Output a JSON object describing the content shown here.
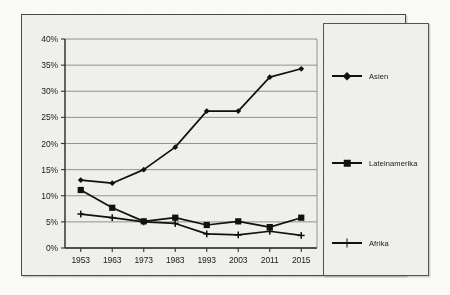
{
  "chart_data": {
    "type": "line",
    "title": "",
    "subtitle": "",
    "xlabel": "",
    "ylabel": "",
    "categories": [
      "1953",
      "1963",
      "1973",
      "1983",
      "1993",
      "2003",
      "2011",
      "2015"
    ],
    "ytick_labels": [
      "0%",
      "5%",
      "10%",
      "15%",
      "20%",
      "25%",
      "30%",
      "35%",
      "40%"
    ],
    "ytick_values": [
      0,
      5,
      10,
      15,
      20,
      25,
      30,
      35,
      40
    ],
    "ylim": [
      0,
      40
    ],
    "grid": "horizontal",
    "legend_position": "right-outside",
    "series": [
      {
        "name": "Asien",
        "marker": "diamond",
        "color": "#111111",
        "values": [
          13.0,
          12.4,
          15.0,
          19.3,
          26.2,
          26.2,
          32.7,
          34.3
        ]
      },
      {
        "name": "Lateinamerika",
        "marker": "square",
        "color": "#111111",
        "values": [
          11.1,
          7.7,
          5.1,
          5.8,
          4.4,
          5.1,
          4.0,
          5.8
        ]
      },
      {
        "name": "Afrika",
        "marker": "plus",
        "color": "#111111",
        "values": [
          6.5,
          5.8,
          5.0,
          4.7,
          2.7,
          2.5,
          3.2,
          2.4
        ]
      }
    ]
  },
  "legend": {
    "entries": [
      {
        "label": "Asien",
        "marker": "diamond"
      },
      {
        "label": "Lateinamerika",
        "marker": "square"
      },
      {
        "label": "Afrika",
        "marker": "plus"
      }
    ]
  },
  "colors": {
    "ink": "#111111",
    "grid": "#8a8a8a",
    "axis": "#333333",
    "plot_bg": "#f2f2ef",
    "page_bg": "#fdfdfb"
  }
}
